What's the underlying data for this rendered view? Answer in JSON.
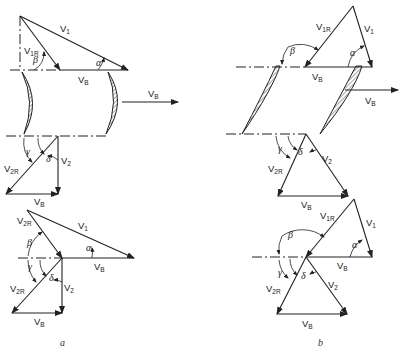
{
  "figure": {
    "panels": [
      {
        "id": "a",
        "caption": "a",
        "upper_triangle": {
          "labels": [
            "V1",
            "V1R",
            "VB",
            "α",
            "β"
          ]
        },
        "blades": {
          "shape": "curved-hatched",
          "motion_label": "VB"
        },
        "lower_triangle": {
          "labels": [
            "V2R",
            "V2",
            "VB",
            "γ",
            "δ"
          ]
        },
        "combined_diagram": {
          "labels": [
            "V2R",
            "V1",
            "β",
            "α",
            "VB",
            "γ",
            "δ",
            "V2R",
            "V2",
            "VB"
          ]
        }
      },
      {
        "id": "b",
        "caption": "b",
        "upper_triangle": {
          "labels": [
            "V1R",
            "V1",
            "β",
            "α",
            "VB"
          ]
        },
        "blades": {
          "shape": "inclined-hatched",
          "motion_label": "VB"
        },
        "lower_triangle": {
          "labels": [
            "γ",
            "δ",
            "V2R",
            "V2",
            "VB"
          ]
        },
        "combined_diagram": {
          "labels": [
            "V1R",
            "V1",
            "β",
            "α",
            "VB",
            "γ",
            "δ",
            "V2R",
            "V2",
            "VB"
          ]
        }
      }
    ],
    "symbols": {
      "V": "V",
      "sub1": "1",
      "sub2": "2",
      "sub1R": "1R",
      "sub2R": "2R",
      "subB": "B",
      "alpha": "α",
      "beta": "β",
      "gamma": "γ",
      "delta": "δ"
    },
    "captions": {
      "a": "a",
      "b": "b"
    }
  }
}
